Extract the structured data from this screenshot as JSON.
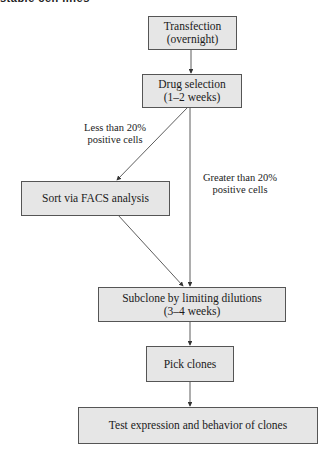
{
  "header": {
    "cut_title": "stable cell lines"
  },
  "nodes": [
    {
      "id": "transfection",
      "line1": "Transfection",
      "line2": "(overnight)"
    },
    {
      "id": "drug-selection",
      "line1": "Drug selection",
      "line2": "(1–2 weeks)"
    },
    {
      "id": "facs",
      "line1": "Sort via FACS analysis"
    },
    {
      "id": "subclone",
      "line1": "Subclone by limiting dilutions",
      "line2": "(3–4 weeks)"
    },
    {
      "id": "pick",
      "line1": "Pick clones"
    },
    {
      "id": "test",
      "line1": "Test expression and behavior of clones"
    }
  ],
  "edge_labels": {
    "less": {
      "line1": "Less than 20%",
      "line2": "positive cells"
    },
    "greater": {
      "line1": "Greater than 20%",
      "line2": "positive cells"
    }
  },
  "colors": {
    "box_fill": "#e6e6e6",
    "box_border": "#555555",
    "arrow": "#333333"
  }
}
